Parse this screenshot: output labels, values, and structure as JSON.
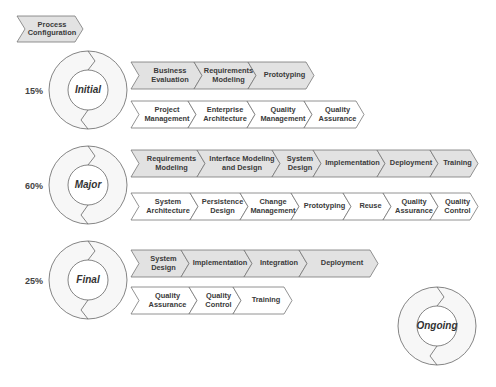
{
  "header": {
    "label": "Process Configuration"
  },
  "colors": {
    "filled": "#e2e2e2",
    "empty": "#ffffff",
    "stroke": "#777777",
    "ring_fill": "#f7f7f7"
  },
  "phases": [
    {
      "name": "Initial",
      "percent": "15%",
      "primary": [
        "Business Evaluation",
        "Requirements Modeling",
        "Prototyping"
      ],
      "secondary": [
        "Project Management",
        "Enterprise Architecture",
        "Quality Management",
        "Quality Assurance"
      ]
    },
    {
      "name": "Major",
      "percent": "60%",
      "primary": [
        "Requirements Modeling",
        "Interface Modeling and Design",
        "System Design",
        "Implementation",
        "Deployment",
        "Training"
      ],
      "secondary": [
        "System Architecture",
        "Persistence Design",
        "Change Management",
        "Prototyping",
        "Reuse",
        "Quality Assurance",
        "Quality Control"
      ]
    },
    {
      "name": "Final",
      "percent": "25%",
      "primary": [
        "System Design",
        "Implementation",
        "Integration",
        "Deployment"
      ],
      "secondary": [
        "Quality Assurance",
        "Quality Control",
        "Training"
      ]
    },
    {
      "name": "Ongoing"
    }
  ]
}
